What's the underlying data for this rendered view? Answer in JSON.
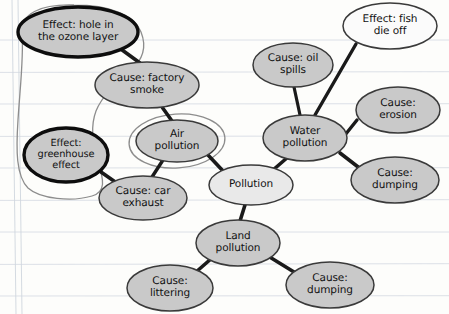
{
  "diagram": {
    "medium": "hand-drawn concept map on lined notebook paper",
    "colors": {
      "paper": "#fdfdfb",
      "rule_line": "#d8dde4",
      "margin_line": "#cfd6de",
      "node_fill_gray": "#c9c9c9",
      "node_fill_light": "#e9e9e9",
      "node_fill_white": "#fbfbfb",
      "node_stroke": "#3a3a3a",
      "node_stroke_bold": "#0d0d0d",
      "edge": "#1a1a1a",
      "lasso": "#8d8d8d",
      "text": "#121212"
    },
    "nodes": [
      {
        "id": "ozone",
        "label_lines": [
          "Effect: hole in",
          "the ozone layer"
        ],
        "cx": 78,
        "cy": 32,
        "rx": 60,
        "ry": 25,
        "fill": "#c9c9c9",
        "stroke": "#0d0d0d",
        "stroke_width": 3.4,
        "emphasis": "bold-outline",
        "font": "normal"
      },
      {
        "id": "factory-smoke",
        "label_lines": [
          "Cause: factory",
          "smoke"
        ],
        "cx": 147,
        "cy": 85,
        "rx": 52,
        "ry": 23,
        "fill": "#c9c9c9",
        "stroke": "#3a3a3a",
        "stroke_width": 1.5,
        "emphasis": "none",
        "font": "normal"
      },
      {
        "id": "greenhouse",
        "label_lines": [
          "Effect:",
          "greenhouse",
          "effect"
        ],
        "cx": 66,
        "cy": 155,
        "rx": 42,
        "ry": 27,
        "fill": "#c9c9c9",
        "stroke": "#0d0d0d",
        "stroke_width": 3.4,
        "emphasis": "bold-outline",
        "font": "normal"
      },
      {
        "id": "air-pollution",
        "label_lines": [
          "Air",
          "pollution"
        ],
        "cx": 177,
        "cy": 141,
        "rx": 41,
        "ry": 21,
        "fill": "#c9c9c9",
        "stroke": "#3a3a3a",
        "stroke_width": 1.5,
        "emphasis": "halo-ring",
        "font": "normal"
      },
      {
        "id": "car-exhaust",
        "label_lines": [
          "Cause: car",
          "exhaust"
        ],
        "cx": 143,
        "cy": 198,
        "rx": 44,
        "ry": 22,
        "fill": "#c9c9c9",
        "stroke": "#3a3a3a",
        "stroke_width": 1.5,
        "emphasis": "none",
        "font": "normal"
      },
      {
        "id": "pollution",
        "label_lines": [
          "Pollution"
        ],
        "cx": 251,
        "cy": 185,
        "rx": 42,
        "ry": 20,
        "fill": "#e9e9e9",
        "stroke": "#3a3a3a",
        "stroke_width": 1.5,
        "emphasis": "none",
        "font": "normal"
      },
      {
        "id": "water-pollution",
        "label_lines": [
          "Water",
          "pollution"
        ],
        "cx": 305,
        "cy": 138,
        "rx": 42,
        "ry": 23,
        "fill": "#c9c9c9",
        "stroke": "#3a3a3a",
        "stroke_width": 1.5,
        "emphasis": "none",
        "font": "normal"
      },
      {
        "id": "oil-spills",
        "label_lines": [
          "Cause: oil",
          "spills"
        ],
        "cx": 293,
        "cy": 65,
        "rx": 40,
        "ry": 22,
        "fill": "#c9c9c9",
        "stroke": "#3a3a3a",
        "stroke_width": 1.5,
        "emphasis": "none",
        "font": "normal"
      },
      {
        "id": "fish-die-off",
        "label_lines": [
          "Effect: fish",
          "die off"
        ],
        "cx": 390,
        "cy": 26,
        "rx": 47,
        "ry": 23,
        "fill": "#fbfbfb",
        "stroke": "#3a3a3a",
        "stroke_width": 1.5,
        "emphasis": "none",
        "font": "normal"
      },
      {
        "id": "erosion",
        "label_lines": [
          "Cause:",
          "erosion"
        ],
        "cx": 398,
        "cy": 110,
        "rx": 42,
        "ry": 23,
        "fill": "#c9c9c9",
        "stroke": "#3a3a3a",
        "stroke_width": 1.5,
        "emphasis": "none",
        "font": "normal"
      },
      {
        "id": "dumping-water",
        "label_lines": [
          "Cause:",
          "dumping"
        ],
        "cx": 395,
        "cy": 180,
        "rx": 44,
        "ry": 23,
        "fill": "#c9c9c9",
        "stroke": "#3a3a3a",
        "stroke_width": 1.5,
        "emphasis": "none",
        "font": "normal"
      },
      {
        "id": "land-pollution",
        "label_lines": [
          "Land",
          "pollution"
        ],
        "cx": 238,
        "cy": 243,
        "rx": 42,
        "ry": 23,
        "fill": "#c9c9c9",
        "stroke": "#3a3a3a",
        "stroke_width": 1.5,
        "emphasis": "none",
        "font": "normal"
      },
      {
        "id": "littering",
        "label_lines": [
          "Cause:",
          "littering"
        ],
        "cx": 170,
        "cy": 288,
        "rx": 43,
        "ry": 23,
        "fill": "#c9c9c9",
        "stroke": "#3a3a3a",
        "stroke_width": 1.5,
        "emphasis": "none",
        "font": "normal"
      },
      {
        "id": "dumping-land",
        "label_lines": [
          "Cause:",
          "dumping"
        ],
        "cx": 330,
        "cy": 285,
        "rx": 44,
        "ry": 23,
        "fill": "#c9c9c9",
        "stroke": "#3a3a3a",
        "stroke_width": 1.5,
        "emphasis": "none",
        "font": "normal"
      }
    ],
    "edges": [
      {
        "id": "ozone-factory",
        "from": "ozone",
        "to": "factory-smoke",
        "x1": 118,
        "y1": 47,
        "x2": 140,
        "y2": 63,
        "width": 3.6
      },
      {
        "id": "factory-air",
        "from": "factory-smoke",
        "to": "air-pollution",
        "x1": 162,
        "y1": 107,
        "x2": 172,
        "y2": 121,
        "width": 3.6
      },
      {
        "id": "greenhouse-car",
        "from": "greenhouse",
        "to": "car-exhaust",
        "x1": 101,
        "y1": 172,
        "x2": 121,
        "y2": 186,
        "width": 3.6
      },
      {
        "id": "air-car",
        "from": "air-pollution",
        "to": "car-exhaust",
        "x1": 163,
        "y1": 160,
        "x2": 152,
        "y2": 177,
        "width": 3.4
      },
      {
        "id": "air-pollution-core",
        "from": "air-pollution",
        "to": "pollution",
        "x1": 208,
        "y1": 155,
        "x2": 224,
        "y2": 172,
        "width": 3.6
      },
      {
        "id": "pollution-water",
        "from": "pollution",
        "to": "water-pollution",
        "x1": 273,
        "y1": 170,
        "x2": 288,
        "y2": 157,
        "width": 3.6
      },
      {
        "id": "pollution-land",
        "from": "pollution",
        "to": "land-pollution",
        "x1": 245,
        "y1": 205,
        "x2": 240,
        "y2": 221,
        "width": 3.6
      },
      {
        "id": "oil-water",
        "from": "oil-spills",
        "to": "water-pollution",
        "x1": 294,
        "y1": 87,
        "x2": 300,
        "y2": 115,
        "width": 3.2
      },
      {
        "id": "fish-water",
        "from": "fish-die-off",
        "to": "water-pollution",
        "x1": 356,
        "y1": 44,
        "x2": 315,
        "y2": 115,
        "width": 3.4
      },
      {
        "id": "erosion-water",
        "from": "erosion",
        "to": "water-pollution",
        "x1": 357,
        "y1": 120,
        "x2": 345,
        "y2": 135,
        "width": 3.4
      },
      {
        "id": "dumping-water-edge",
        "from": "water-pollution",
        "to": "dumping-water",
        "x1": 340,
        "y1": 153,
        "x2": 362,
        "y2": 170,
        "width": 3.6
      },
      {
        "id": "land-littering",
        "from": "land-pollution",
        "to": "littering",
        "x1": 212,
        "y1": 258,
        "x2": 196,
        "y2": 272,
        "width": 3.6
      },
      {
        "id": "land-dumping",
        "from": "land-pollution",
        "to": "dumping-land",
        "x1": 268,
        "y1": 256,
        "x2": 294,
        "y2": 272,
        "width": 3.6
      }
    ],
    "annotations": [
      {
        "id": "effects-lasso",
        "type": "hand-drawn-enclosure",
        "description": "large freehand loop grouping the two bold Effect ovals",
        "stroke": "#8d8d8d"
      },
      {
        "id": "air-pollution-ring",
        "type": "hand-drawn-circle",
        "description": "freehand circle drawn around the Air pollution node",
        "stroke": "#8d8d8d"
      }
    ],
    "paper": {
      "rule_line_ys": [
        40,
        72,
        104,
        136,
        168,
        200,
        232,
        264,
        296
      ],
      "margin_x": 12
    }
  }
}
